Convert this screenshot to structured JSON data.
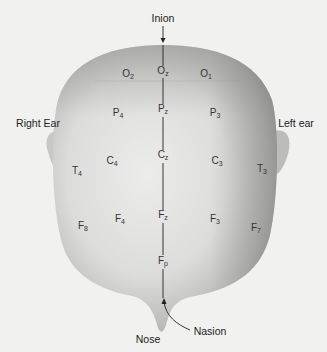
{
  "figure": {
    "title_labels": {
      "inion": "Inion",
      "nasion": "Nasion",
      "nose": "Nose",
      "right_ear": "Right Ear",
      "left_ear": "Left ear"
    },
    "electrodes": [
      {
        "id": "O2",
        "letter": "O",
        "sub": "2",
        "x": 128,
        "y": 75
      },
      {
        "id": "Oz",
        "letter": "O",
        "sub": "z",
        "x": 163,
        "y": 72
      },
      {
        "id": "O1",
        "letter": "O",
        "sub": "1",
        "x": 206,
        "y": 75
      },
      {
        "id": "P4",
        "letter": "P",
        "sub": "4",
        "x": 118,
        "y": 114
      },
      {
        "id": "Pz",
        "letter": "P",
        "sub": "z",
        "x": 163,
        "y": 110
      },
      {
        "id": "P3",
        "letter": "P",
        "sub": "3",
        "x": 215,
        "y": 114
      },
      {
        "id": "C4",
        "letter": "C",
        "sub": "4",
        "x": 112,
        "y": 162
      },
      {
        "id": "Cz",
        "letter": "C",
        "sub": "z",
        "x": 163,
        "y": 156
      },
      {
        "id": "C3",
        "letter": "C",
        "sub": "3",
        "x": 217,
        "y": 162
      },
      {
        "id": "T4",
        "letter": "T",
        "sub": "4",
        "x": 77,
        "y": 172
      },
      {
        "id": "T3",
        "letter": "T",
        "sub": "3",
        "x": 262,
        "y": 170
      },
      {
        "id": "F8",
        "letter": "F",
        "sub": "8",
        "x": 83,
        "y": 227
      },
      {
        "id": "F4",
        "letter": "F",
        "sub": "4",
        "x": 120,
        "y": 220
      },
      {
        "id": "Fz",
        "letter": "F",
        "sub": "z",
        "x": 163,
        "y": 216
      },
      {
        "id": "F3",
        "letter": "F",
        "sub": "3",
        "x": 215,
        "y": 220
      },
      {
        "id": "F7",
        "letter": "F",
        "sub": "7",
        "x": 256,
        "y": 229
      },
      {
        "id": "Fp",
        "letter": "F",
        "sub": "p",
        "x": 163,
        "y": 262
      }
    ]
  }
}
